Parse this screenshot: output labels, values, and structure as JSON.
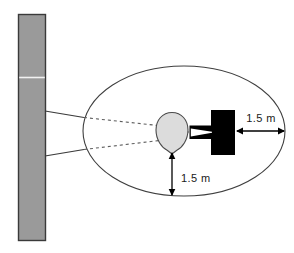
{
  "figure": {
    "type": "technical-diagram",
    "background_color": "#ffffff"
  },
  "wall": {
    "name": "wall",
    "fill_color": "#9a9a9a",
    "stroke_color": "#3a3a3a",
    "x": 18,
    "y": 14,
    "width": 27,
    "height": 226,
    "seam_y": 77,
    "seam_color": "#ffffff"
  },
  "ellipse": {
    "name": "coverage-zone",
    "center_x": 184,
    "center_y": 131,
    "radius_x": 101,
    "radius_y": 65,
    "stroke_color": "#3f3f3f",
    "fill": "none"
  },
  "head": {
    "name": "head",
    "center_x": 172,
    "center_y": 132,
    "radius_x": 16,
    "radius_y": 19,
    "fill_color": "#d9d9d9",
    "stroke_color": "#4a4a4a"
  },
  "device": {
    "name": "device",
    "fill_color": "#000000",
    "body_x": 211,
    "body_y": 110,
    "body_width": 24,
    "body_height": 45,
    "stem_x": 190,
    "stem_y": 126,
    "stem_width": 21,
    "stem_height": 13
  },
  "sight_lines": {
    "name": "sight-lines",
    "solid_color": "#3a3a3a",
    "dashed_color": "#6a6a6a",
    "upper": {
      "wall_x": 45,
      "wall_y": 111,
      "fold_x": 84,
      "fold_y": 117,
      "head_x": 172,
      "head_y": 127
    },
    "lower": {
      "wall_x": 45,
      "wall_y": 156,
      "fold_x": 84,
      "fold_y": 150,
      "head_x": 172,
      "head_y": 139
    }
  },
  "dimensions": [
    {
      "id": "horizontal-dimension",
      "label": "1.5 m",
      "value": 1.5,
      "unit": "m",
      "orientation": "horizontal",
      "from_x": 236,
      "to_x": 285,
      "y": 131,
      "label_x": 261,
      "label_y": 122,
      "color": "#000000"
    },
    {
      "id": "vertical-dimension",
      "label": "1.5 m",
      "value": 1.5,
      "unit": "m",
      "orientation": "vertical",
      "x": 172,
      "from_y": 152,
      "to_y": 196,
      "label_x": 192,
      "label_y": 178,
      "color": "#000000"
    }
  ]
}
